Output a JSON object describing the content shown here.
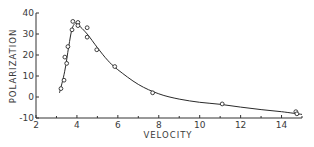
{
  "chart_data": {
    "type": "scatter",
    "title": "",
    "xlabel": "VELOCITY",
    "ylabel": "POLARIZATION",
    "xlim": [
      2,
      15
    ],
    "ylim": [
      -10,
      40
    ],
    "x_ticks": [
      2,
      4,
      6,
      8,
      10,
      12,
      14
    ],
    "x_minor_ticks": [
      3,
      5,
      7,
      9,
      11,
      13,
      15
    ],
    "y_ticks": [
      -10,
      0,
      10,
      20,
      30,
      40
    ],
    "grid": false,
    "legend": null,
    "series": [
      {
        "name": "measured",
        "marker": "open-circle",
        "points": [
          {
            "x": 3.22,
            "y": 4
          },
          {
            "x": 3.37,
            "y": 8
          },
          {
            "x": 3.41,
            "y": 19
          },
          {
            "x": 3.5,
            "y": 16
          },
          {
            "x": 3.56,
            "y": 24
          },
          {
            "x": 3.76,
            "y": 32
          },
          {
            "x": 3.8,
            "y": 36
          },
          {
            "x": 4.05,
            "y": 35.5
          },
          {
            "x": 4.05,
            "y": 34
          },
          {
            "x": 4.5,
            "y": 33
          },
          {
            "x": 4.5,
            "y": 28.5
          },
          {
            "x": 4.97,
            "y": 22.5
          },
          {
            "x": 5.85,
            "y": 14.5
          },
          {
            "x": 7.7,
            "y": 2
          },
          {
            "x": 11.1,
            "y": -3.3
          },
          {
            "x": 14.7,
            "y": -7
          },
          {
            "x": 14.75,
            "y": -8
          }
        ]
      },
      {
        "name": "fit",
        "style": "line",
        "points": [
          {
            "x": 3.15,
            "y": 2
          },
          {
            "x": 3.4,
            "y": 12
          },
          {
            "x": 3.6,
            "y": 24
          },
          {
            "x": 3.75,
            "y": 32
          },
          {
            "x": 3.9,
            "y": 35
          },
          {
            "x": 4.05,
            "y": 34.5
          },
          {
            "x": 4.5,
            "y": 30
          },
          {
            "x": 5.0,
            "y": 23.5
          },
          {
            "x": 5.5,
            "y": 17.5
          },
          {
            "x": 6.0,
            "y": 13
          },
          {
            "x": 7.0,
            "y": 6
          },
          {
            "x": 8.0,
            "y": 1.5
          },
          {
            "x": 9.0,
            "y": -1
          },
          {
            "x": 10.0,
            "y": -2.5
          },
          {
            "x": 11.0,
            "y": -3.5
          },
          {
            "x": 12.0,
            "y": -4.8
          },
          {
            "x": 13.0,
            "y": -6
          },
          {
            "x": 14.0,
            "y": -7
          },
          {
            "x": 15.0,
            "y": -8.3
          }
        ]
      }
    ]
  },
  "axes": {
    "x_title": "VELOCITY",
    "y_title": "POLARIZATION"
  }
}
